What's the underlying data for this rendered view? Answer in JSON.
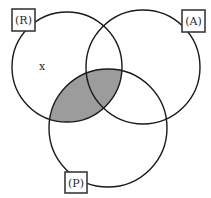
{
  "diagram": {
    "type": "venn",
    "sets": [
      {
        "id": "R",
        "label": "(R)",
        "cx": 67,
        "cy": 67,
        "r": 55
      },
      {
        "id": "A",
        "label": "(A)",
        "cx": 143,
        "cy": 67,
        "r": 57
      },
      {
        "id": "P",
        "label": "(P)",
        "cx": 108,
        "cy": 128,
        "r": 59
      }
    ],
    "shaded_region": "R ∩ P",
    "shade_color": "#9c9c9c",
    "marker": {
      "text": "x",
      "region": "R only"
    },
    "labels": {
      "R": "(R)",
      "A": "(A)",
      "P": "(P)"
    }
  }
}
